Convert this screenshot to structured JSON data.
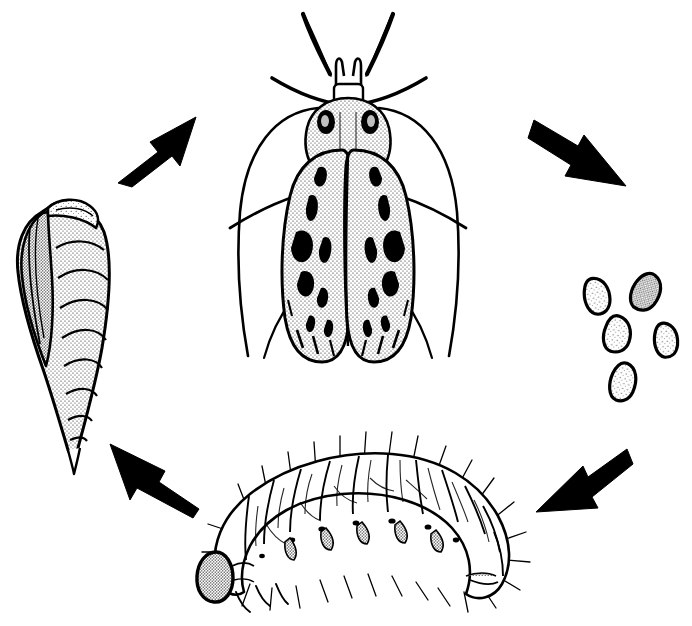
{
  "figure": {
    "background_color": "#ffffff",
    "ink_color": "#000000",
    "width": 692,
    "height": 626,
    "cycle_direction": "clockwise",
    "caption": ""
  },
  "stages": [
    {
      "id": "pupa",
      "label": "pupa",
      "position": "left",
      "center_x": 62,
      "center_y": 330,
      "description": "elongate segmented pupa with wing cases"
    },
    {
      "id": "adult",
      "label": "adult moth",
      "position": "top",
      "center_x": 348,
      "center_y": 190,
      "description": "adult moth with folded stippled forewings, dark spots, long antennae and labial palps"
    },
    {
      "id": "eggs",
      "label": "eggs",
      "position": "right",
      "center_x": 622,
      "center_y": 337,
      "count": 5,
      "description": "cluster of five oval eggs"
    },
    {
      "id": "larva",
      "label": "larva",
      "position": "bottom",
      "center_x": 360,
      "center_y": 528,
      "description": "arched caterpillar with dark head capsule and scattered setae"
    }
  ],
  "arrows": [
    {
      "id": "arrow-pupa-to-adult",
      "label": "pupa to adult",
      "from": "pupa",
      "to": "adult",
      "direction": "up-right",
      "tail_x": 118,
      "tail_y": 180,
      "tip_x": 195,
      "tip_y": 120
    },
    {
      "id": "arrow-adult-to-eggs",
      "label": "adult to eggs",
      "from": "adult",
      "to": "eggs",
      "direction": "down-right",
      "tail_x": 534,
      "tail_y": 123,
      "tip_x": 622,
      "tip_y": 180
    },
    {
      "id": "arrow-eggs-to-larva",
      "label": "eggs to larva",
      "from": "eggs",
      "to": "larva",
      "direction": "down-left",
      "tail_x": 625,
      "tail_y": 452,
      "tip_x": 540,
      "tip_y": 512
    },
    {
      "id": "arrow-larva-to-pupa",
      "label": "larva to pupa",
      "from": "larva",
      "to": "pupa",
      "direction": "up-left",
      "tail_x": 198,
      "tail_y": 505,
      "tip_x": 110,
      "tip_y": 447
    }
  ],
  "adult_detail": {
    "antennae": 2,
    "labial_palps": 2,
    "legs_visible": 4,
    "forewing_spots": 12,
    "wing_shading": "stipple"
  },
  "larva_detail": {
    "segments": 12,
    "head_capsule": "dark stippled",
    "setae": "long scattered hairs"
  },
  "pupa_detail": {
    "abdominal_segments": 8,
    "shading": "stipple",
    "orientation": "head up, tilted right"
  },
  "egg_detail": {
    "eggs": [
      {
        "cx": 597,
        "cy": 296,
        "rx": 13,
        "ry": 18,
        "rot": -12
      },
      {
        "cx": 646,
        "cy": 292,
        "rx": 14,
        "ry": 19,
        "rot": 28
      },
      {
        "cx": 617,
        "cy": 334,
        "rx": 14,
        "ry": 18,
        "rot": 8
      },
      {
        "cx": 666,
        "cy": 340,
        "rx": 12,
        "ry": 17,
        "rot": -6
      },
      {
        "cx": 623,
        "cy": 382,
        "rx": 13,
        "ry": 19,
        "rot": 14
      }
    ]
  }
}
